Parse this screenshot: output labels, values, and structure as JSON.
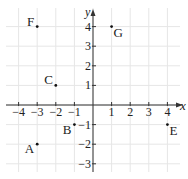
{
  "figure": {
    "x_axis_label": "x",
    "y_axis_label": "y",
    "x_ticks": [
      -4,
      -3,
      -2,
      -1,
      1,
      2,
      3,
      4
    ],
    "y_ticks": [
      -3,
      -2,
      -1,
      1,
      2,
      3,
      4
    ],
    "x_range": [
      -4.6,
      4.9
    ],
    "y_range": [
      -4.1,
      4.6
    ],
    "grid": true,
    "grid_color": "#e6e6e6",
    "axis_color": "#333333",
    "points": [
      {
        "label": "A",
        "x": -3,
        "y": -2,
        "label_pos": "left-below"
      },
      {
        "label": "B",
        "x": -1,
        "y": -1,
        "label_pos": "left-below"
      },
      {
        "label": "C",
        "x": -2,
        "y": 1,
        "label_pos": "left-above"
      },
      {
        "label": "D",
        "x": 0,
        "y": -4,
        "label_pos": "right"
      },
      {
        "label": "E",
        "x": 4,
        "y": -1,
        "label_pos": "right-below"
      },
      {
        "label": "F",
        "x": -3,
        "y": 4,
        "label_pos": "left-above"
      },
      {
        "label": "G",
        "x": 1,
        "y": 4,
        "label_pos": "right-below"
      }
    ]
  }
}
